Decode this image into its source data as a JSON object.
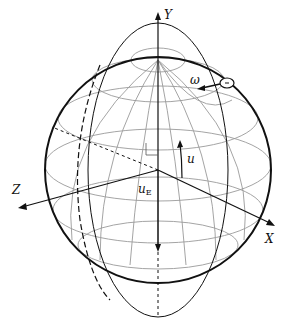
{
  "diagram": {
    "type": "sphere-coordinate-figure",
    "labels": {
      "y_axis": "Y",
      "x_axis": "X",
      "z_axis": "Z",
      "omega": "ω",
      "u": "u",
      "uE_main": "u",
      "uE_sub": "E"
    },
    "colors": {
      "outline": "#111111",
      "grid": "#9a9a9a",
      "background": "#ffffff"
    }
  }
}
